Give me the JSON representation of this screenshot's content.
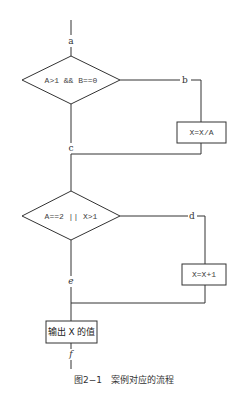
{
  "diagram": {
    "type": "flowchart",
    "nodes": {
      "decision1": "A>1 && B==0",
      "process1": "X=X/A",
      "decision2": "A==2 || X>1",
      "process2": "X=X+1",
      "output": "输出 X 的值"
    },
    "path_labels": {
      "a": "a",
      "b": "b",
      "c": "c",
      "d": "d",
      "e": "e",
      "f": "f"
    },
    "caption": "图2−1　案例对应的流程"
  }
}
